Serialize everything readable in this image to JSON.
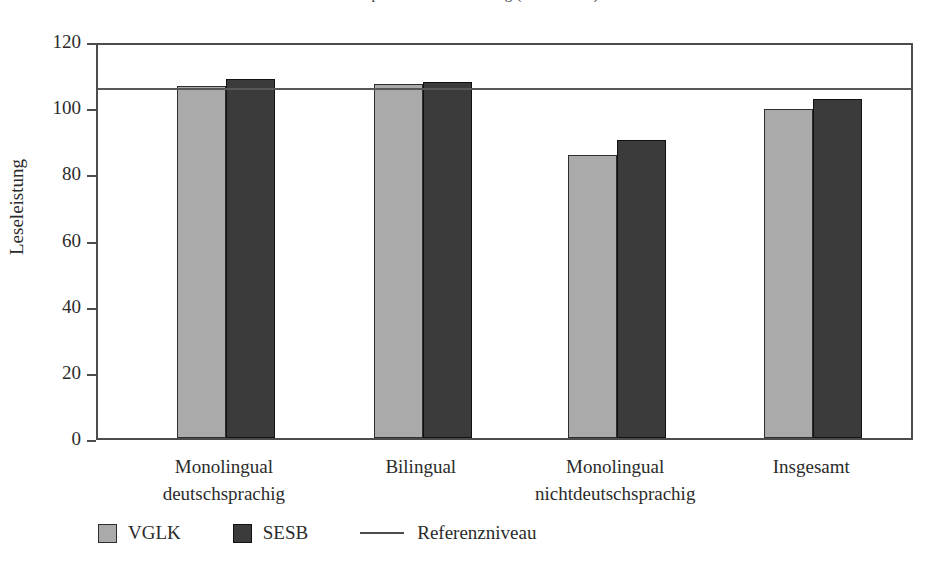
{
  "title_partial": "Kompetenzstufenverteilung (Mittelwerte)",
  "chart_data": {
    "type": "bar",
    "title": "",
    "xlabel": "",
    "ylabel": "Leseleistung",
    "ylim": [
      0,
      120
    ],
    "yticks": [
      0,
      20,
      40,
      60,
      80,
      100,
      120
    ],
    "grid": false,
    "legend_position": "bottom-left",
    "categories": [
      "Monolingual\ndeutschsprachig",
      "Bilingual",
      "Monolingual\nnichtdeutschsprachig",
      "Insgesamt"
    ],
    "category_lines": [
      [
        "Monolingual",
        "deutschsprachig"
      ],
      [
        "Bilingual",
        ""
      ],
      [
        "Monolingual",
        "nichtdeutschsprachig"
      ],
      [
        "Insgesamt",
        ""
      ]
    ],
    "series": [
      {
        "name": "VGLK",
        "color": "#aaaaaa",
        "values": [
          106.5,
          107.0,
          85.5,
          99.3
        ]
      },
      {
        "name": "SESB",
        "color": "#3b3b3b",
        "values": [
          108.5,
          107.5,
          90.2,
          102.5
        ]
      }
    ],
    "reference_line": {
      "name": "Referenzniveau",
      "value": 107.0,
      "color": "#575757"
    }
  },
  "axis": {
    "ytick_labels": [
      "120",
      "100",
      "80",
      "60",
      "40",
      "20",
      "0"
    ],
    "ylabel": "Leseleistung"
  },
  "legend": {
    "items": [
      {
        "label": "VGLK",
        "kind": "swatch"
      },
      {
        "label": "SESB",
        "kind": "swatch"
      },
      {
        "label": "Referenzniveau",
        "kind": "line"
      }
    ]
  }
}
